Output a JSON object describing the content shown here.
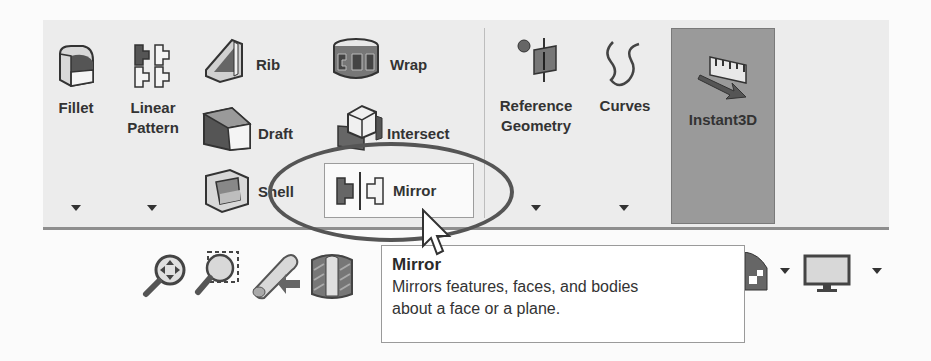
{
  "ribbon": {
    "features_group": {
      "fillet": {
        "label": "Fillet",
        "icon": "fillet-icon"
      },
      "linear_pattern": {
        "label_line1": "Linear",
        "label_line2": "Pattern",
        "icon": "linear-pattern-icon"
      },
      "rib": {
        "label": "Rib",
        "icon": "rib-icon"
      },
      "draft": {
        "label": "Draft",
        "icon": "draft-icon"
      },
      "shell": {
        "label": "Shell",
        "icon": "shell-icon"
      },
      "wrap": {
        "label": "Wrap",
        "icon": "wrap-icon"
      },
      "intersect": {
        "label": "Intersect",
        "icon": "intersect-icon"
      },
      "mirror": {
        "label": "Mirror",
        "icon": "mirror-icon"
      }
    },
    "reference_group": {
      "reference_geometry": {
        "label_line1": "Reference",
        "label_line2": "Geometry",
        "icon": "reference-geometry-icon"
      },
      "curves": {
        "label": "Curves",
        "icon": "curves-icon"
      }
    },
    "instant3d": {
      "label": "Instant3D",
      "icon": "instant3d-icon",
      "state": "active"
    }
  },
  "view_toolbar": {
    "items": [
      {
        "name": "zoom-to-fit",
        "icon": "zoom-to-fit-icon"
      },
      {
        "name": "zoom-to-area",
        "icon": "zoom-to-area-icon"
      },
      {
        "name": "previous-view",
        "icon": "previous-view-icon"
      },
      {
        "name": "section-view",
        "icon": "section-view-icon"
      },
      {
        "name": "display-style",
        "icon": "display-style-icon"
      },
      {
        "name": "view-settings",
        "icon": "monitor-icon"
      }
    ]
  },
  "tooltip": {
    "title": "Mirror",
    "line1": "Mirrors features, faces, and bodies",
    "line2": "about a face or a plane."
  },
  "colors": {
    "ribbon_bg": "#ececec",
    "instant3d_active": "#9a9a9a",
    "annotation_ellipse": "#555555"
  }
}
